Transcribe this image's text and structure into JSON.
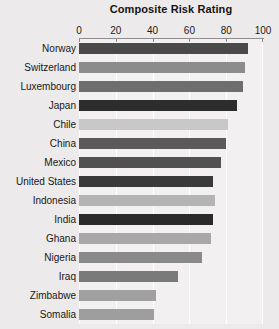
{
  "chart_data": {
    "type": "bar",
    "orientation": "horizontal",
    "title": "Composite Risk Rating",
    "xlabel": "",
    "ylabel": "",
    "xlim": [
      0,
      100
    ],
    "xticks": [
      0,
      20,
      40,
      60,
      80,
      100
    ],
    "xtick_labels": [
      "0",
      "20",
      "40",
      "60",
      "80",
      "100"
    ],
    "grid": true,
    "grid_axis": "x",
    "legend": "none",
    "categories": [
      "Norway",
      "Switzerland",
      "Luxembourg",
      "Japan",
      "Chile",
      "China",
      "Mexico",
      "United States",
      "Indonesia",
      "India",
      "Ghana",
      "Nigeria",
      "Iraq",
      "Zimbabwe",
      "Somalia"
    ],
    "values": [
      92,
      90,
      89,
      86,
      81,
      80,
      77,
      73,
      74,
      73,
      72,
      67,
      54,
      42,
      41
    ],
    "bar_colors": [
      "#4a4a4a",
      "#8c8c8c",
      "#6e6e6e",
      "#2d2d2d",
      "#c8c8c8",
      "#5a5a5a",
      "#515151",
      "#3a3a3a",
      "#b4b4b4",
      "#2a2a2a",
      "#a8a8a8",
      "#8a8a8a",
      "#7a7a7a",
      "#a0a0a0",
      "#9e9e9e"
    ],
    "plot_background": "#f2f0f0",
    "figure_background": "#eceaea",
    "gridline_color": "#ffffff",
    "axis_color": "#8e8c8c",
    "text_color": "#171717"
  }
}
